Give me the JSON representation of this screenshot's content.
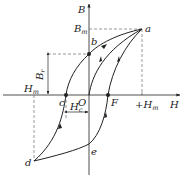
{
  "figure": {
    "axes": {
      "x_label": "H",
      "y_label": "B",
      "origin_label": "O"
    },
    "points": {
      "a": "a",
      "b": "b",
      "c": "c",
      "d": "d",
      "e": "e",
      "F": "F"
    },
    "annotations": {
      "Bm": {
        "main": "B",
        "sub": "m"
      },
      "Br": {
        "main": "B",
        "sub": "r"
      },
      "Hm_neg": {
        "main": "H",
        "sub": "m"
      },
      "Hm_pos": {
        "prefix": "+",
        "main": "H",
        "sub": "m"
      },
      "Hc": {
        "main": "H",
        "sub": "c"
      }
    },
    "colors": {
      "stroke": "#222222",
      "dashed": "#555555",
      "background": "#ffffff"
    }
  }
}
